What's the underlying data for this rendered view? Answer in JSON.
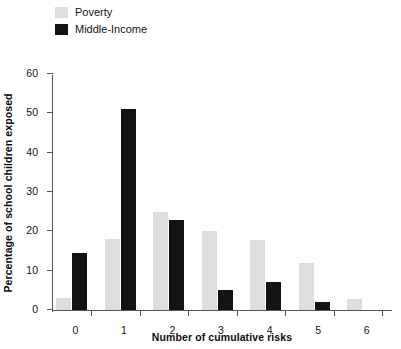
{
  "chart_data": {
    "type": "bar",
    "title": "",
    "xlabel": "Number of cumulative risks",
    "ylabel": "Percentage of school children exposed",
    "categories": [
      "0",
      "1",
      "2",
      "3",
      "4",
      "5",
      "6"
    ],
    "ylim": [
      0,
      60
    ],
    "yticks": [
      0,
      10,
      20,
      30,
      40,
      50,
      60
    ],
    "ytick_labels": [
      "0",
      "10",
      "20",
      "30",
      "40",
      "50",
      "60"
    ],
    "grid": false,
    "legend_position": "top-left",
    "series": [
      {
        "name": "Poverty",
        "color": "#dedede",
        "values": [
          3,
          18,
          25,
          20,
          17.8,
          12,
          2.8
        ]
      },
      {
        "name": "Middle-Income",
        "color": "#131313",
        "values": [
          14.5,
          51,
          23,
          5,
          7,
          2,
          null
        ]
      }
    ]
  },
  "legend": {
    "items": [
      {
        "label": "Poverty",
        "swatch_name": "poverty-swatch"
      },
      {
        "label": "Middle-Income",
        "swatch_name": "middle-income-swatch"
      }
    ]
  },
  "axes": {
    "y_title": "Percentage of school children exposed",
    "x_title": "Number of cumulative risks"
  }
}
